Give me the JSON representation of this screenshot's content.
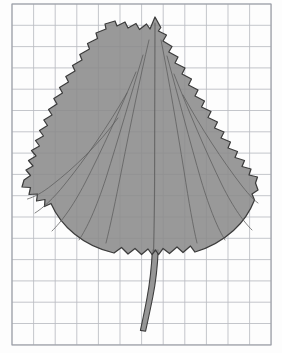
{
  "figure": {
    "specimen_name": "serrated broad leaf silhouette",
    "caption": "",
    "background_type": "graph-paper",
    "colors": {
      "leaf_fill": "#8b8b8b",
      "leaf_outline": "#3c3c3c",
      "vein": "#5e5e5e",
      "grid_line": "#b9bcc2",
      "grid_frame": "#9a9ea6",
      "paper": "#fdfdfd"
    }
  },
  "grid": {
    "label": "graph-paper-grid",
    "origin_x": 12,
    "origin_y": 4,
    "columns": 12,
    "rows": 16,
    "cell_width": 21.6,
    "cell_height": 21.3,
    "right_edge": 271,
    "bottom_edge": 345
  },
  "leaf": {
    "label": "leaf-outline",
    "apex_x": 155,
    "apex_y": 17,
    "blade_bottom_y": 256,
    "blade_left_x": 22,
    "blade_right_x": 258,
    "petiole_top_y": 256,
    "petiole_bottom_y": 331,
    "vein_count": 9,
    "margin_type": "serrate"
  },
  "chart_data": {
    "type": "scatter",
    "title": "",
    "xlabel": "",
    "ylabel": "",
    "categories": [],
    "values": []
  }
}
